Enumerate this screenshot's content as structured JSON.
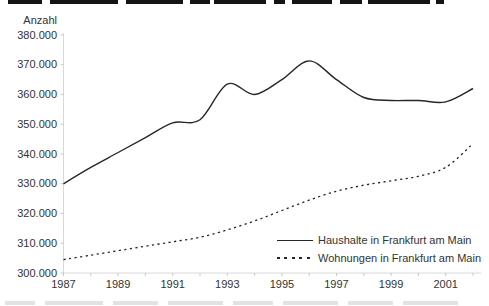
{
  "chart_data": {
    "type": "line",
    "title": "",
    "xlabel": "",
    "ylabel": "Anzahl",
    "grid": false,
    "legend_position": "inside-bottom-right",
    "ylim": [
      300000,
      380000
    ],
    "y_tick_step": 10000,
    "y_tick_labels": [
      "300.000",
      "310.000",
      "320.000",
      "330.000",
      "340.000",
      "350.000",
      "360.000",
      "370.000",
      "380.000"
    ],
    "x_tick_years": [
      1987,
      1989,
      1991,
      1993,
      1995,
      1997,
      1999,
      2001
    ],
    "x": [
      1987,
      1988,
      1989,
      1990,
      1991,
      1992,
      1993,
      1994,
      1995,
      1996,
      1997,
      1998,
      1999,
      2000,
      2001,
      2002
    ],
    "series": [
      {
        "name": "Haushalte in Frankfurt am Main",
        "style": "solid",
        "values": [
          330000,
          335500,
          340500,
          345500,
          350500,
          351500,
          363500,
          360000,
          365000,
          371300,
          365000,
          359000,
          358000,
          358000,
          357500,
          362000
        ]
      },
      {
        "name": "Wohnungen in Frankfurt am Main",
        "style": "dashed",
        "values": [
          304500,
          306000,
          307500,
          309000,
          310500,
          312000,
          314500,
          317500,
          321000,
          324500,
          327500,
          329500,
          331000,
          332500,
          335500,
          343500
        ]
      }
    ]
  },
  "colors": {
    "line": "#262626",
    "axis": "#d8d8d8",
    "tick": "#c8c8c8",
    "text": "#333333",
    "crop_top": "#141414",
    "crop_bottom": "#e3e3e3"
  }
}
